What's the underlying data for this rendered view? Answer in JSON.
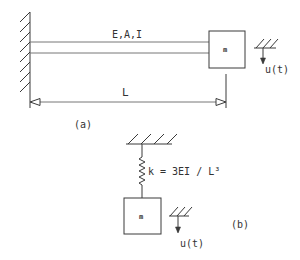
{
  "figure": {
    "part_a": {
      "caption": "(a)",
      "beam_label": "E,A,I",
      "length_label": "L",
      "mass_label": "m",
      "displacement_label": "u(t)",
      "support": "fixed-wall"
    },
    "part_b": {
      "caption": "(b)",
      "spring_label": "k = 3EI / L³",
      "mass_label": "m",
      "displacement_label": "u(t)",
      "support": "fixed-ceiling"
    },
    "colors": {
      "line": "#3a3a3a",
      "background": "#ffffff"
    }
  }
}
